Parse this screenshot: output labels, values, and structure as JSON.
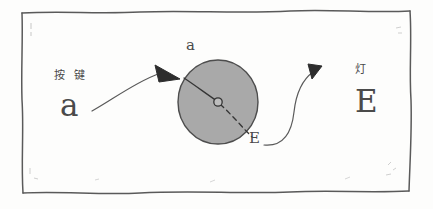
{
  "diagram": {
    "style": "hand-drawn pencil sketch",
    "frame": {
      "name": "sketch-border",
      "stroke_color": "#555555"
    },
    "palette": {
      "ink": "#3b3b3b",
      "disc_fill": "#a8a8a8",
      "disc_stroke": "#4f4f4f",
      "paper": "#fdfdfc"
    },
    "left_group": {
      "cjk_label": "按 键",
      "glyph_label": "a"
    },
    "right_group": {
      "cjk_label": "灯",
      "glyph_label": "E"
    },
    "disc": {
      "name": "rotating-disc",
      "entry_glyph": "a",
      "exit_glyph": "E",
      "hub_label": ""
    },
    "arrows": [
      {
        "name": "arrow-key-to-disc",
        "from": "a",
        "to": "disc"
      },
      {
        "name": "arrow-disc-to-lamp",
        "from": "E",
        "to": "lamp"
      }
    ]
  }
}
